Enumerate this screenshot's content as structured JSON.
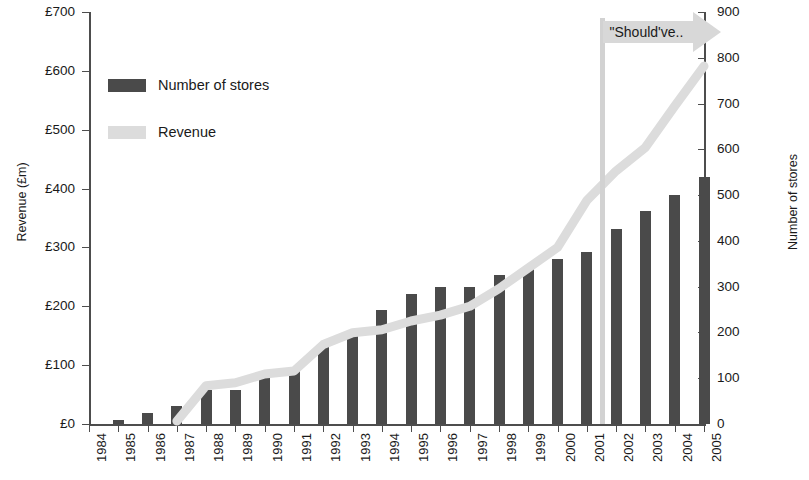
{
  "chart_data": {
    "type": "bar",
    "title": "",
    "xlabel": "",
    "categories": [
      "1984",
      "1985",
      "1986",
      "1987",
      "1988",
      "1989",
      "1990",
      "1991",
      "1992",
      "1993",
      "1994",
      "1995",
      "1996",
      "1997",
      "1998",
      "1999",
      "2000",
      "2001",
      "2002",
      "2003",
      "2004",
      "2005"
    ],
    "series": [
      {
        "name": "Number of stores",
        "type": "bar",
        "axis": "right",
        "color": "#4a4a4a",
        "values": [
          1,
          8,
          25,
          40,
          75,
          75,
          100,
          120,
          175,
          200,
          250,
          285,
          300,
          300,
          325,
          340,
          360,
          375,
          425,
          465,
          500,
          540
        ]
      },
      {
        "name": "Revenue",
        "type": "line",
        "axis": "left",
        "color": "#dcdcdc",
        "values": [
          0,
          0,
          0,
          5,
          65,
          70,
          85,
          90,
          135,
          155,
          160,
          175,
          185,
          200,
          230,
          265,
          300,
          380,
          430,
          470,
          540,
          608
        ]
      }
    ],
    "left_axis": {
      "label": "Revenue (£m)",
      "ticks": [
        "£0",
        "£100",
        "£200",
        "£300",
        "£400",
        "£500",
        "£600",
        "£700"
      ],
      "min": 0,
      "max": 700,
      "step": 100
    },
    "right_axis": {
      "label": "Number of stores",
      "ticks": [
        "0",
        "100",
        "200",
        "300",
        "400",
        "500",
        "600",
        "700",
        "800",
        "900"
      ],
      "min": 0,
      "max": 900,
      "step": 100
    },
    "legend": {
      "position": "top-left",
      "entries": [
        {
          "label": "Number of stores",
          "color": "#4a4a4a"
        },
        {
          "label": "Revenue",
          "color": "#dcdcdc"
        }
      ]
    },
    "annotations": [
      {
        "name": "marker-line",
        "at_category": "2001",
        "color": "#d2d2d2"
      },
      {
        "name": "callout",
        "text": "\"Should've..",
        "arrow": "right",
        "color": "#d2d2d2"
      }
    ],
    "grid": false
  }
}
